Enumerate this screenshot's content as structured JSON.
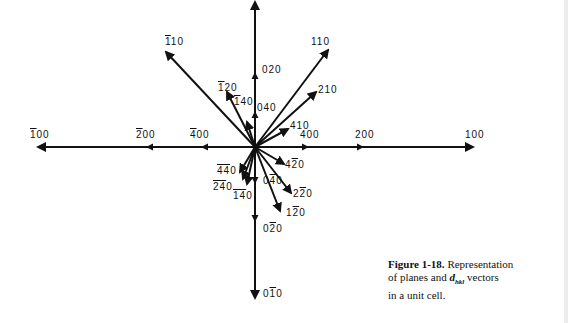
{
  "figure": {
    "origin": [
      255,
      147
    ],
    "axes": {
      "horizontal": {
        "x1": 38,
        "x2": 473,
        "y": 147
      },
      "vertical": {
        "x": 255,
        "y1": 2,
        "y2": 298
      }
    },
    "vectors": [
      {
        "label": "110",
        "bars": "1",
        "tip": [
          166,
          52
        ],
        "axis": "none"
      },
      {
        "label": "110",
        "bars": "",
        "tip": [
          328,
          50
        ],
        "axis": "none"
      },
      {
        "label": "210",
        "bars": "",
        "tip": [
          316,
          92
        ],
        "axis": "none"
      },
      {
        "label": "120",
        "bars": "1",
        "tip": [
          227,
          92
        ],
        "axis": "none"
      },
      {
        "label": "140",
        "bars": "1",
        "tip": [
          247,
          122
        ],
        "axis": "none"
      },
      {
        "label": "410",
        "bars": "",
        "tip": [
          288,
          129
        ],
        "axis": "none"
      },
      {
        "label": "420",
        "bars": "2",
        "tip": [
          284,
          166
        ],
        "axis": "none"
      },
      {
        "label": "220",
        "bars": "2",
        "tip": [
          291,
          193
        ],
        "axis": "none"
      },
      {
        "label": "120",
        "bars": "2",
        "tip": [
          281,
          210
        ],
        "axis": "none"
      },
      {
        "label": "440",
        "bars": "44",
        "tip": [
          241,
          172
        ],
        "axis": "none"
      },
      {
        "label": "240",
        "bars": "24",
        "tip": [
          244,
          180
        ],
        "axis": "none"
      },
      {
        "label": "140",
        "bars": "14",
        "tip": [
          247,
          185
        ],
        "axis": "none"
      }
    ],
    "axis_points": {
      "horizontal": [
        {
          "label": "100",
          "bars": "1",
          "x": 38
        },
        {
          "label": "200",
          "bars": "2",
          "x": 150
        },
        {
          "label": "400",
          "bars": "4",
          "x": 205
        },
        {
          "label": "400",
          "bars": "",
          "x": 305
        },
        {
          "label": "200",
          "bars": "",
          "x": 360
        },
        {
          "label": "100",
          "bars": "",
          "x": 473
        }
      ],
      "vertical": [
        {
          "label": "040",
          "bars": "",
          "y": 115
        },
        {
          "label": "020",
          "bars": "",
          "y": 76
        },
        {
          "label": "040",
          "bars": "4",
          "y": 180
        },
        {
          "label": "020",
          "bars": "2",
          "y": 218
        },
        {
          "label": "010",
          "bars": "1",
          "y": 298
        }
      ]
    }
  },
  "labels": {
    "l_m110": {
      "pre": "",
      "bar": "1",
      "post": "10"
    },
    "l_110": {
      "pre": "110",
      "bar": "",
      "post": ""
    },
    "l_020": {
      "pre": "020",
      "bar": "",
      "post": ""
    },
    "l_210": {
      "pre": "210",
      "bar": "",
      "post": ""
    },
    "l_m120": {
      "pre": "",
      "bar": "1",
      "post": "20"
    },
    "l_m140": {
      "pre": "",
      "bar": "1",
      "post": "40"
    },
    "l_040": {
      "pre": "040",
      "bar": "",
      "post": ""
    },
    "l_410": {
      "pre": "410",
      "bar": "",
      "post": ""
    },
    "l_m100": {
      "pre": "",
      "bar": "1",
      "post": "00"
    },
    "l_m200": {
      "pre": "",
      "bar": "2",
      "post": "00"
    },
    "l_m400": {
      "pre": "",
      "bar": "4",
      "post": "00"
    },
    "l_400": {
      "pre": "400",
      "bar": "",
      "post": ""
    },
    "l_200": {
      "pre": "200",
      "bar": "",
      "post": ""
    },
    "l_100": {
      "pre": "100",
      "bar": "",
      "post": ""
    },
    "l_4m20": {
      "pre": "4",
      "bar": "2",
      "post": "0"
    },
    "l_2m20": {
      "pre": "2",
      "bar": "2",
      "post": "0"
    },
    "l_1m20": {
      "pre": "1",
      "bar": "2",
      "post": "0"
    },
    "l_0m20": {
      "pre": "0",
      "bar": "2",
      "post": "0"
    },
    "l_0m40": {
      "pre": "0",
      "bar": "4",
      "post": "0"
    },
    "l_0m10": {
      "pre": "0",
      "bar": "1",
      "post": "0"
    },
    "l_m4m40": {
      "pre": "",
      "bar": "44",
      "post": "0"
    },
    "l_m2m40": {
      "pre": "",
      "bar": "24",
      "post": "0"
    },
    "l_m1m40": {
      "pre": "",
      "bar": "14",
      "post": "0"
    }
  },
  "caption": {
    "figure_label": "Figure 1-18.",
    "text_1": " Representation",
    "text_2": "of planes and ",
    "d": "d",
    "subscript": "hkl",
    "text_3": " vectors",
    "text_4": "in a unit cell."
  }
}
